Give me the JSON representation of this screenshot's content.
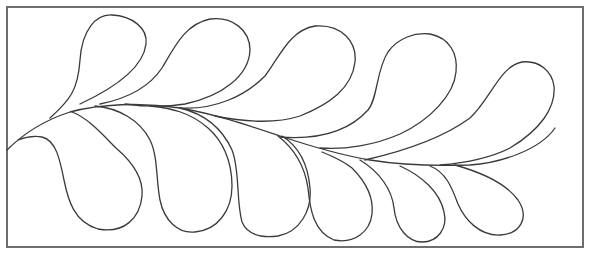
{
  "figure": {
    "frame_color": "#6e6e6e",
    "line_color": "#3a3a3a",
    "background": "#ffffff",
    "feather_count_top": 5,
    "feather_count_bottom": 6
  }
}
